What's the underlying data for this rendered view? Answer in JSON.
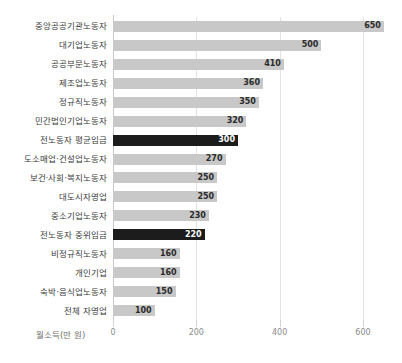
{
  "title": "",
  "chart_data": {
    "type": "bar",
    "orientation": "horizontal",
    "title": "",
    "xlabel": "월소득(만 원)",
    "ylabel": "",
    "xlim": [
      0,
      660
    ],
    "xticks": [
      0,
      200,
      400,
      600
    ],
    "xtick_labels": [
      "0",
      "200",
      "400",
      "600"
    ],
    "grid": true,
    "legend": false,
    "value_labels": true,
    "colors": {
      "bar": "#c8c8c8",
      "highlight_bar": "#1c1c1c",
      "gridline": "#e3e3e3",
      "axis": "#c9c9c9",
      "label_text": "#3c3c3c",
      "tick_text": "#8a8a8a"
    },
    "categories": [
      "중앙공공기관노동자",
      "대기업노동자",
      "공공부문노동자",
      "제조업노동자",
      "정규직노동자",
      "민간법인기업노동자",
      "전노동자 평균임금",
      "도소매업·건설업노동자",
      "보건·사회·복지노동자",
      "대도시자영업",
      "중소기업노동자",
      "전노동자 중위임금",
      "비정규직노동자",
      "개인기업",
      "숙박·음식업노동자",
      "전체 자영업"
    ],
    "values": [
      650,
      500,
      410,
      360,
      350,
      320,
      300,
      270,
      250,
      250,
      230,
      220,
      160,
      160,
      150,
      100
    ],
    "highlight": [
      false,
      false,
      false,
      false,
      false,
      false,
      true,
      false,
      false,
      false,
      false,
      true,
      false,
      false,
      false,
      false
    ]
  }
}
